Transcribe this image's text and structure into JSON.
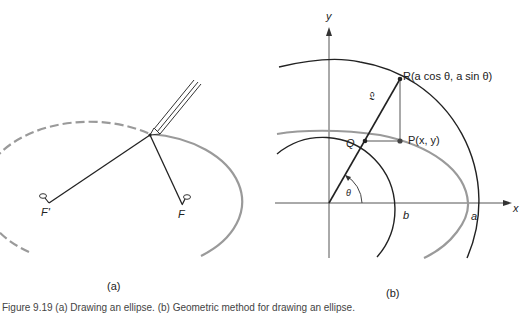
{
  "figure": {
    "caption": "Figure 9.19 (a) Drawing an ellipse. (b) Geometric method for drawing an ellipse.",
    "panels": [
      {
        "id": "a",
        "label": "(a)",
        "description": "Pins-and-string construction of an ellipse with a pencil",
        "foci": [
          {
            "label": "F'",
            "x": 48,
            "y": 203
          },
          {
            "label": "F",
            "x": 182,
            "y": 205
          }
        ],
        "pencil_tip": {
          "x": 150,
          "y": 135
        },
        "ellipse": {
          "cx": 113,
          "cy": 200,
          "rx": 103,
          "ry": 68,
          "drawn_part": "solid on right, dashed on left"
        }
      },
      {
        "id": "b",
        "label": "(b)",
        "description": "Eccentric-angle construction of an ellipse using two concentric circles",
        "axes": {
          "x_label": "x",
          "y_label": "y"
        },
        "points": {
          "R": "R(a cos θ, a sin θ)",
          "P": "P(x, y)",
          "Q": "Q"
        },
        "labels": {
          "angle": "θ",
          "line": "𝔏",
          "inner_radius": "b",
          "outer_radius": "a"
        },
        "geometry": {
          "origin": [
            329,
            203
          ],
          "a": 140,
          "b": 72,
          "theta_deg": 60
        }
      }
    ]
  }
}
